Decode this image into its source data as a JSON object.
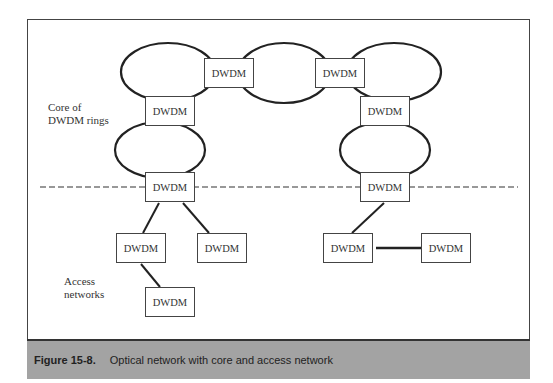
{
  "diagram": {
    "node_label": "DWDM",
    "region_labels": {
      "core": [
        "Core of",
        "DWDM rings"
      ],
      "access": [
        "Access",
        "networks"
      ]
    },
    "nodes": [
      {
        "id": "top-left",
        "label": "DWDM"
      },
      {
        "id": "top-right",
        "label": "DWDM"
      },
      {
        "id": "left-mid",
        "label": "DWDM"
      },
      {
        "id": "right-mid",
        "label": "DWDM"
      },
      {
        "id": "left-gateway",
        "label": "DWDM"
      },
      {
        "id": "right-gateway",
        "label": "DWDM"
      },
      {
        "id": "left-access-a",
        "label": "DWDM"
      },
      {
        "id": "left-access-b",
        "label": "DWDM"
      },
      {
        "id": "left-access-c",
        "label": "DWDM"
      },
      {
        "id": "right-access-a",
        "label": "DWDM"
      },
      {
        "id": "right-access-b",
        "label": "DWDM"
      }
    ],
    "edges": [
      [
        "left-gateway",
        "left-access-a"
      ],
      [
        "left-gateway",
        "left-access-b"
      ],
      [
        "left-access-a",
        "left-access-c"
      ],
      [
        "right-gateway",
        "right-access-a"
      ],
      [
        "right-access-a",
        "right-access-b"
      ]
    ],
    "rings": 5,
    "divider": "dashed"
  },
  "caption": {
    "number": "Figure 15-8.",
    "text": "Optical network with core and access network"
  }
}
